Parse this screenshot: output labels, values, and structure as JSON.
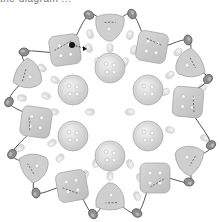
{
  "caption": {
    "text": "the diagram ...",
    "note": "cropped, illegible text at top edge"
  },
  "colors": {
    "button_fill": "#cfcfcf",
    "button_stroke": "#a8a8a8",
    "round_fill": "#dcdcdc",
    "hole": "#f4f4f4",
    "seed_fill": "#e2e2e2",
    "wire_bead_fill": "#8e8e8e",
    "wire_bead_stroke": "#555555",
    "wire": "#444444"
  },
  "diagram": {
    "inner_round_buttons": [
      {
        "x": 110,
        "y": 68
      },
      {
        "x": 148,
        "y": 90
      },
      {
        "x": 148,
        "y": 136
      },
      {
        "x": 110,
        "y": 156
      },
      {
        "x": 73,
        "y": 136
      },
      {
        "x": 73,
        "y": 90
      }
    ],
    "square_buttons": [
      {
        "x": 65,
        "y": 50,
        "r": -8
      },
      {
        "x": 152,
        "y": 47,
        "r": 10
      },
      {
        "x": 188,
        "y": 102,
        "r": 5
      },
      {
        "x": 155,
        "y": 178,
        "r": 0
      },
      {
        "x": 72,
        "y": 186,
        "r": -10
      },
      {
        "x": 36,
        "y": 122,
        "r": 8
      }
    ],
    "shield_buttons": [
      {
        "x": 110,
        "y": 25,
        "r": 0
      },
      {
        "x": 191,
        "y": 64,
        "r": 60
      },
      {
        "x": 190,
        "y": 160,
        "r": 120
      },
      {
        "x": 110,
        "y": 199,
        "r": 180
      },
      {
        "x": 33,
        "y": 167,
        "r": 240
      },
      {
        "x": 27,
        "y": 74,
        "r": 300
      }
    ],
    "wire_beads": [
      {
        "x": 89,
        "y": 15
      },
      {
        "x": 132,
        "y": 14
      },
      {
        "x": 188,
        "y": 40
      },
      {
        "x": 208,
        "y": 79
      },
      {
        "x": 211,
        "y": 145
      },
      {
        "x": 189,
        "y": 182
      },
      {
        "x": 137,
        "y": 213
      },
      {
        "x": 93,
        "y": 214
      },
      {
        "x": 36,
        "y": 193
      },
      {
        "x": 12,
        "y": 154
      },
      {
        "x": 9,
        "y": 102
      },
      {
        "x": 24,
        "y": 52
      }
    ],
    "seed_beads": [
      {
        "x": 90,
        "y": 34
      },
      {
        "x": 130,
        "y": 35
      },
      {
        "x": 178,
        "y": 52
      },
      {
        "x": 89,
        "y": 48
      },
      {
        "x": 134,
        "y": 50
      },
      {
        "x": 98,
        "y": 62
      },
      {
        "x": 125,
        "y": 62
      },
      {
        "x": 170,
        "y": 75
      },
      {
        "x": 202,
        "y": 88
      },
      {
        "x": 165,
        "y": 92
      },
      {
        "x": 170,
        "y": 130
      },
      {
        "x": 205,
        "y": 138
      },
      {
        "x": 162,
        "y": 175
      },
      {
        "x": 180,
        "y": 160
      },
      {
        "x": 130,
        "y": 164
      },
      {
        "x": 96,
        "y": 163
      },
      {
        "x": 140,
        "y": 178
      },
      {
        "x": 85,
        "y": 175
      },
      {
        "x": 84,
        "y": 195
      },
      {
        "x": 137,
        "y": 196
      },
      {
        "x": 60,
        "y": 158
      },
      {
        "x": 52,
        "y": 143
      },
      {
        "x": 54,
        "y": 112
      },
      {
        "x": 55,
        "y": 80
      },
      {
        "x": 22,
        "y": 98
      },
      {
        "x": 20,
        "y": 148
      },
      {
        "x": 42,
        "y": 68
      },
      {
        "x": 46,
        "y": 96
      },
      {
        "x": 110,
        "y": 48
      },
      {
        "x": 110,
        "y": 176
      },
      {
        "x": 90,
        "y": 112
      },
      {
        "x": 130,
        "y": 112
      }
    ],
    "needle_marker": {
      "x": 72,
      "y": 45,
      "arrow_to_x": 84,
      "arrow_to_y": 48
    }
  }
}
